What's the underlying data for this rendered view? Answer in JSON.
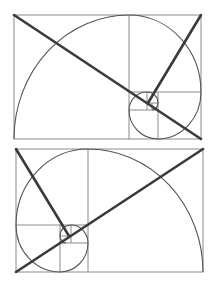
{
  "figure": {
    "title": "Golden ratio spiral compositions",
    "colors": {
      "background": "#ffffff",
      "grid_line": "#8a8a8a",
      "spiral": "#555555",
      "diagonal": "#3a3a3a"
    },
    "panels": [
      {
        "id": "top",
        "description": "Golden rectangle with spiral curling into lower-right; two diagonals meeting at the spiral eye",
        "rect": {
          "x": 14,
          "y": 15,
          "w": 187,
          "h": 124
        }
      },
      {
        "id": "bottom",
        "description": "Mirrored golden rectangle with spiral curling into lower-left; two diagonals meeting at the spiral eye",
        "rect": {
          "x": 16,
          "y": 149,
          "w": 187,
          "h": 123
        }
      }
    ]
  }
}
